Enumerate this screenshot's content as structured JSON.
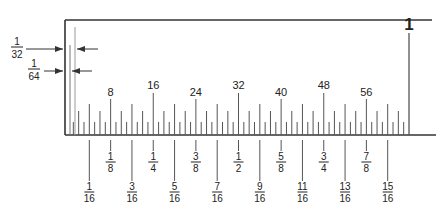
{
  "diagram": {
    "colors": {
      "line": "#333333",
      "tick": "#444444",
      "text": "#222222",
      "background": "#ffffff"
    },
    "callouts": [
      {
        "label_num": "1",
        "label_den": "32",
        "meaning": "1/32 inch spacing"
      },
      {
        "label_num": "1",
        "label_den": "64",
        "meaning": "1/64 inch spacing"
      }
    ],
    "top_labels": [
      "8",
      "16",
      "24",
      "32",
      "40",
      "48",
      "56"
    ],
    "inch_label": "1",
    "eighth_labels": [
      {
        "num": "1",
        "den": "8"
      },
      {
        "num": "1",
        "den": "4"
      },
      {
        "num": "3",
        "den": "8"
      },
      {
        "num": "1",
        "den": "2"
      },
      {
        "num": "5",
        "den": "8"
      },
      {
        "num": "3",
        "den": "4"
      },
      {
        "num": "7",
        "den": "8"
      }
    ],
    "sixteenth_labels": [
      {
        "num": "1",
        "den": "16"
      },
      {
        "num": "3",
        "den": "16"
      },
      {
        "num": "5",
        "den": "16"
      },
      {
        "num": "7",
        "den": "16"
      },
      {
        "num": "9",
        "den": "16"
      },
      {
        "num": "11",
        "den": "16"
      },
      {
        "num": "13",
        "den": "16"
      },
      {
        "num": "15",
        "den": "16"
      }
    ],
    "divisions_per_inch": 64
  }
}
